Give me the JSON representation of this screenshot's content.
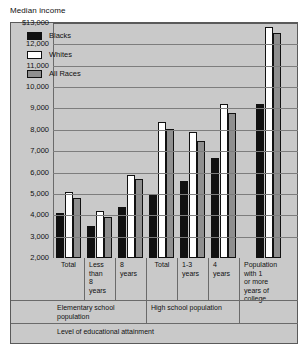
{
  "chart_data": {
    "type": "bar",
    "title": "Median income",
    "xlabel": "Level of educational attainment",
    "ylabel": "Median income",
    "ylim": [
      2000,
      13000
    ],
    "grid": true,
    "legend_position": "top-left inside plot",
    "ytick_labels": [
      "$13,000",
      "12,000",
      "11,000",
      "10,000",
      "9,000",
      "8,000",
      "7,000",
      "6,000",
      "5,000",
      "4,000",
      "3,000",
      "2,000"
    ],
    "ytick_values": [
      13000,
      12000,
      11000,
      10000,
      9000,
      8000,
      7000,
      6000,
      5000,
      4000,
      3000,
      2000
    ],
    "categories": [
      "Total",
      "Less than 8 years",
      "8 years",
      "Total",
      "1-3 years",
      "4 years",
      "Population with 1 or more years of college"
    ],
    "category_lines": [
      [
        "Total"
      ],
      [
        "Less",
        "than",
        "8",
        "years"
      ],
      [
        "8",
        "years"
      ],
      [
        "Total"
      ],
      [
        "1-3",
        "years"
      ],
      [
        "4",
        "years"
      ],
      [
        "Population",
        "with 1",
        "or more",
        "years of",
        "college"
      ]
    ],
    "groups": [
      {
        "label": "Elementary school population",
        "span": 3
      },
      {
        "label": "High school population",
        "span": 3
      },
      {
        "label": "",
        "span": 1
      }
    ],
    "series": [
      {
        "name": "Blacks",
        "color": "#111111",
        "values": [
          4100,
          3500,
          4400,
          5000,
          5600,
          6700,
          9200
        ]
      },
      {
        "name": "Whites",
        "color": "#ffffff",
        "values": [
          5100,
          4200,
          5900,
          8350,
          7900,
          9200,
          12800
        ]
      },
      {
        "name": "All Races",
        "color": "#8f8f8f",
        "values": [
          4800,
          3900,
          5700,
          8050,
          7500,
          8800,
          12550
        ]
      }
    ]
  },
  "legend": {
    "items": [
      {
        "label": "Blacks"
      },
      {
        "label": "Whites"
      },
      {
        "label": "All Races"
      }
    ]
  }
}
